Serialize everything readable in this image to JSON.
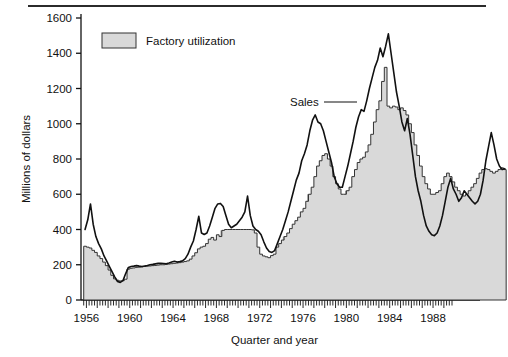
{
  "figure": {
    "width": 508,
    "height": 357,
    "background": "#ffffff",
    "top_rule_color": "#2b2b2b"
  },
  "legend": {
    "position": "top-left-inside",
    "entries": [
      {
        "label": "Factory utilization",
        "swatch_fill": "#d9d9d9",
        "swatch_stroke": "#333333"
      }
    ]
  },
  "annotations": [
    {
      "name": "sales-callout",
      "text": "Sales",
      "leader": true
    }
  ],
  "colors": {
    "area_fill": "#d9d9d9",
    "area_stroke": "#333333",
    "line_stroke": "#111111",
    "recession_bar": "#9a9a9a",
    "axis": "#111111",
    "text": "#111111"
  },
  "chart_data": {
    "type": "area",
    "title": "",
    "subtitle": "",
    "xlabel": "Quarter and year",
    "ylabel": "Millions of dollars",
    "xlim": [
      1955.5,
      1989.75
    ],
    "ylim": [
      0,
      1600
    ],
    "yticks": [
      0,
      200,
      400,
      600,
      800,
      1000,
      1200,
      1400,
      1600
    ],
    "xticks": [
      1956,
      1960,
      1964,
      1968,
      1972,
      1976,
      1980,
      1984,
      1988
    ],
    "xtick_labels": [
      "1956",
      "1960",
      "1964",
      "1968",
      "1972",
      "1976",
      "1980",
      "1984",
      "1988"
    ],
    "minor_xticks": "every quarter",
    "grid": false,
    "legend_position": "upper left",
    "x_unit": "quarter",
    "x_start": 1955.75,
    "x_step": 0.25,
    "series": [
      {
        "name": "Factory utilization",
        "render": "step-area",
        "values": [
          305,
          300,
          295,
          282,
          270,
          250,
          235,
          215,
          195,
          170,
          140,
          120,
          112,
          108,
          110,
          118,
          175,
          180,
          182,
          185,
          186,
          188,
          190,
          192,
          193,
          195,
          196,
          198,
          200,
          200,
          202,
          204,
          206,
          208,
          210,
          212,
          215,
          218,
          222,
          232,
          250,
          268,
          290,
          300,
          305,
          320,
          345,
          355,
          340,
          370,
          360,
          395,
          400,
          400,
          400,
          400,
          400,
          400,
          400,
          400,
          400,
          400,
          398,
          380,
          300,
          260,
          250,
          245,
          240,
          252,
          260,
          300,
          320,
          340,
          360,
          380,
          405,
          430,
          450,
          470,
          500,
          520,
          560,
          600,
          640,
          700,
          760,
          790,
          820,
          830,
          800,
          760,
          700,
          660,
          630,
          600,
          600,
          620,
          640,
          700,
          740,
          780,
          800,
          810,
          840,
          880,
          940,
          1010,
          1080,
          1130,
          1240,
          1320,
          1100,
          1090,
          1100,
          1095,
          1080,
          1090,
          1075,
          1050,
          1000,
          950,
          880,
          820,
          760,
          700,
          660,
          630,
          600,
          600,
          610,
          620,
          660,
          700,
          720,
          700,
          670,
          640,
          620,
          600,
          590,
          600,
          620,
          640,
          660,
          690,
          720,
          740,
          745,
          740,
          730,
          720,
          730,
          740,
          750,
          740
        ]
      },
      {
        "name": "Sales",
        "render": "line",
        "values": [
          400,
          455,
          545,
          430,
          360,
          320,
          290,
          250,
          220,
          190,
          160,
          130,
          105,
          100,
          110,
          150,
          185,
          190,
          192,
          195,
          192,
          190,
          193,
          196,
          200,
          202,
          205,
          208,
          208,
          207,
          206,
          210,
          215,
          220,
          215,
          218,
          222,
          235,
          260,
          300,
          335,
          400,
          475,
          380,
          372,
          380,
          420,
          470,
          520,
          545,
          548,
          530,
          480,
          430,
          410,
          420,
          430,
          450,
          470,
          500,
          590,
          480,
          420,
          400,
          390,
          370,
          330,
          295,
          275,
          270,
          280,
          320,
          360,
          400,
          450,
          500,
          560,
          620,
          680,
          720,
          790,
          830,
          880,
          960,
          1020,
          1050,
          1010,
          1000,
          960,
          900,
          840,
          780,
          700,
          660,
          640,
          640,
          700,
          760,
          830,
          900,
          980,
          1040,
          1080,
          1070,
          1130,
          1200,
          1260,
          1320,
          1360,
          1430,
          1380,
          1440,
          1510,
          1400,
          1290,
          1180,
          1100,
          1010,
          960,
          1030,
          940,
          820,
          700,
          620,
          560,
          480,
          420,
          390,
          370,
          365,
          380,
          420,
          480,
          560,
          640,
          690,
          630,
          600,
          560,
          580,
          620,
          600,
          580,
          560,
          545,
          560,
          600,
          680,
          790,
          870,
          950,
          880,
          800,
          760,
          740,
          745
        ]
      }
    ],
    "recession_markers": [
      {
        "year": 1957.75,
        "label": ""
      },
      {
        "year": 1968.5,
        "label": ""
      },
      {
        "year": 1970.5,
        "label": ""
      },
      {
        "year": 1974.25,
        "label": ""
      },
      {
        "year": 1976.5,
        "label": ""
      },
      {
        "year": 1980.0,
        "label": ""
      },
      {
        "year": 1984.75,
        "label": ""
      },
      {
        "year": 1986.5,
        "label": ""
      }
    ]
  }
}
